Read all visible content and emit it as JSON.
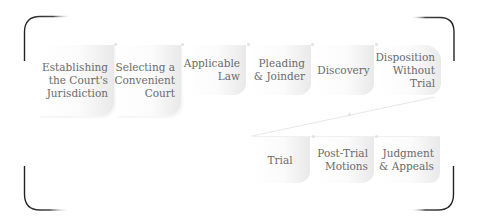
{
  "diagram": {
    "type": "process-flow",
    "row1": [
      {
        "id": "jurisdiction",
        "label": "Establishing\nthe Court's\nJurisdiction"
      },
      {
        "id": "venue",
        "label": "Selecting a\nConvenient\nCourt"
      },
      {
        "id": "law",
        "label": "Applicable\nLaw"
      },
      {
        "id": "pleading",
        "label": "Pleading\n& Joinder"
      },
      {
        "id": "discovery",
        "label": "Discovery"
      },
      {
        "id": "disposition",
        "label": "Disposition\nWithout Trial"
      }
    ],
    "row2": [
      {
        "id": "trial",
        "label": "Trial"
      },
      {
        "id": "post-trial",
        "label": "Post-Trial\nMotions"
      },
      {
        "id": "judgment",
        "label": "Judgment\n& Appeals"
      }
    ],
    "colors": {
      "bracket": "#222222",
      "text": "#6b6b6b",
      "box_light": "#ffffff",
      "box_dark": "#e9e9e9",
      "connector": "#e6e6e6"
    }
  }
}
